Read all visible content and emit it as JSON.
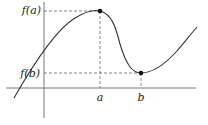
{
  "diagram": {
    "type": "function-graph",
    "labels": {
      "fa": "f(a)",
      "fb": "f(b)",
      "a": "a",
      "b": "b"
    },
    "points": {
      "max": {
        "label": "a",
        "value_label": "f(a)",
        "kind": "local maximum"
      },
      "min": {
        "label": "b",
        "value_label": "f(b)",
        "kind": "local minimum"
      }
    },
    "colors": {
      "curve": "#333333",
      "axes": "#555555",
      "dashes": "#555555"
    }
  }
}
